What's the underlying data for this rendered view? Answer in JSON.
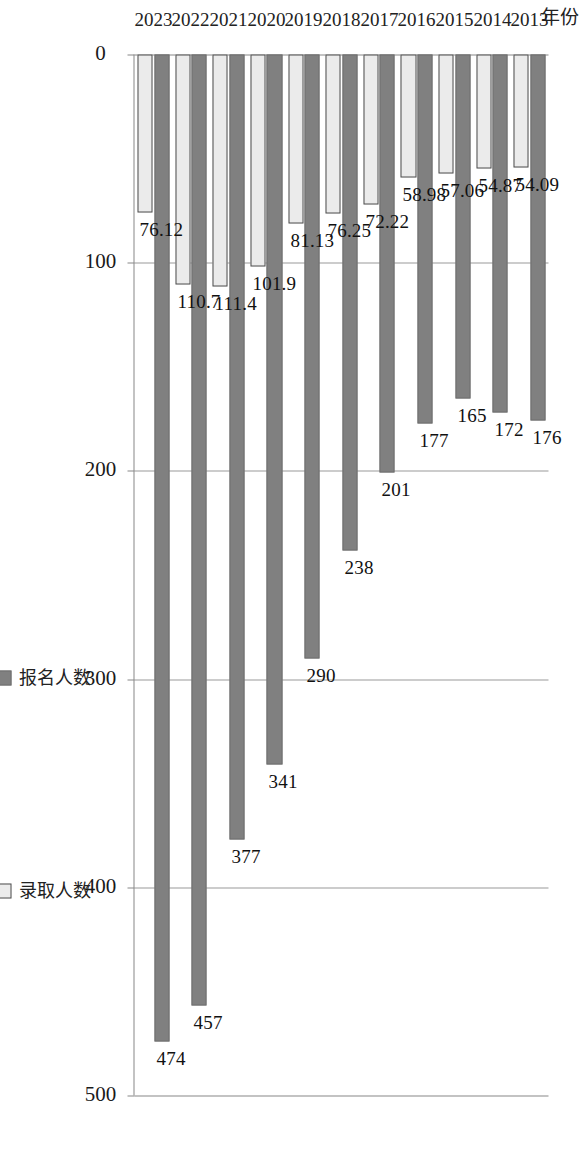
{
  "chart_data": {
    "type": "bar",
    "orientation": "horizontal",
    "title": "",
    "subtitle": "",
    "xlabel": "",
    "ylabel": "年份",
    "categories": [
      "2013",
      "2014",
      "2015",
      "2016",
      "2017",
      "2018",
      "2019",
      "2020",
      "2021",
      "2022",
      "2023"
    ],
    "series": [
      {
        "name": "报名人数",
        "color": "#808080",
        "values": [
          176,
          172,
          165,
          177,
          201,
          238,
          290,
          341,
          377,
          457,
          474
        ],
        "labels": [
          "176",
          "172",
          "165",
          "177",
          "201",
          "238",
          "290",
          "341",
          "377",
          "457",
          "474"
        ]
      },
      {
        "name": "录取人数",
        "color": "#ebebeb",
        "values": [
          54.09,
          54.87,
          57.06,
          58.98,
          72.22,
          76.25,
          81.13,
          101.9,
          111.4,
          110.7,
          76.12
        ],
        "labels": [
          "54.09",
          "54.87",
          "57.06",
          "58.98",
          "72.22",
          "76.25",
          "81.13",
          "101.9",
          "111.4",
          "110.7",
          "76.12"
        ]
      }
    ],
    "value_axis": {
      "ticks": [
        0,
        100,
        200,
        300,
        400,
        500
      ],
      "tick_labels": [
        "0",
        "100",
        "200",
        "300",
        "400",
        "500"
      ],
      "min": 0,
      "max": 500
    },
    "grid": true,
    "gridlines": "value-axis-major",
    "legend": {
      "position": "right",
      "entries": [
        {
          "label": "报名人数",
          "swatch": "series-apply"
        },
        {
          "label": "录取人数",
          "swatch": "series-admit"
        }
      ]
    },
    "data_labels": true,
    "plot_area_border": false,
    "rotation_note": "chart rendered rotated 90 degrees in source image"
  },
  "axis_title": {
    "category": "年份"
  },
  "colors": {
    "series_apply": "#808080",
    "series_admit": "#ebebeb",
    "axis": "#888888",
    "gridline": "#9a9a9a",
    "text": "#222222",
    "background": "#ffffff"
  }
}
